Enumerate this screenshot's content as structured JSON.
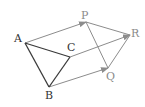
{
  "diagram": {
    "type": "translation-of-triangle",
    "colors": {
      "original": "#3a3a3a",
      "image": "#8c8c8c",
      "arrows": "#8c8c8c",
      "labels_original": "#333333",
      "labels_image": "#8a8a8a"
    },
    "points": {
      "A": {
        "label": "A",
        "x": 25,
        "y": 43,
        "lx": 14,
        "ly": 42
      },
      "B": {
        "label": "B",
        "x": 49,
        "y": 87,
        "lx": 45,
        "ly": 99
      },
      "C": {
        "label": "C",
        "x": 70,
        "y": 57,
        "lx": 67,
        "ly": 51
      },
      "P": {
        "label": "P",
        "x": 86,
        "y": 22,
        "lx": 81,
        "ly": 19
      },
      "Q": {
        "label": "Q",
        "x": 108,
        "y": 68,
        "lx": 106,
        "ly": 80
      },
      "R": {
        "label": "R",
        "x": 130,
        "y": 35,
        "lx": 131,
        "ly": 37
      }
    },
    "triangle_original": [
      "A",
      "B",
      "C"
    ],
    "triangle_image": [
      "P",
      "Q",
      "R"
    ],
    "arrows": [
      {
        "from": "A",
        "to": "P"
      },
      {
        "from": "C",
        "to": "R"
      },
      {
        "from": "B",
        "to": "Q"
      }
    ]
  }
}
